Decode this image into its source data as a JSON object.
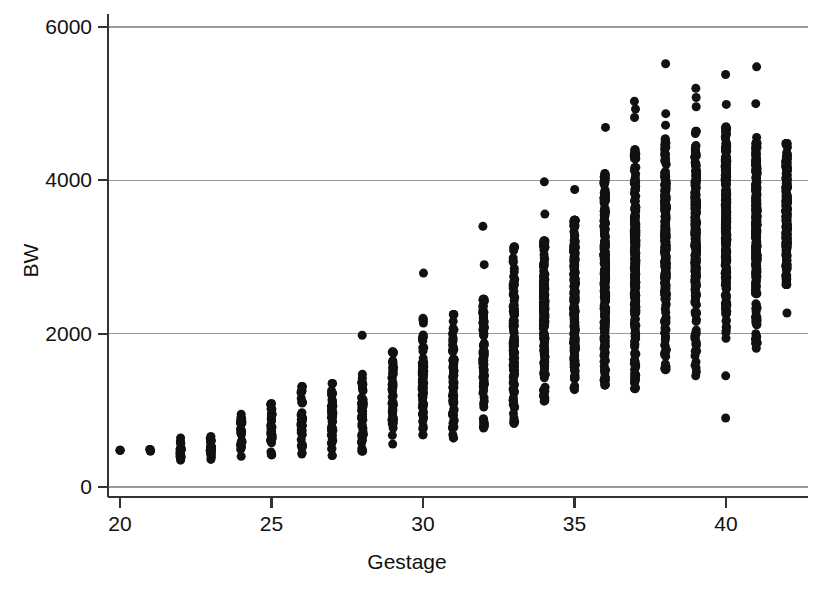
{
  "chart_data": {
    "type": "scatter",
    "title": "",
    "xlabel": "Gestage",
    "ylabel": "BW",
    "xlim": [
      19.2,
      42.8
    ],
    "ylim": [
      -250,
      6250
    ],
    "xticks": [
      20,
      25,
      30,
      35,
      40
    ],
    "yticks": [
      0,
      2000,
      4000,
      6000
    ],
    "grid": "horizontal",
    "grid_color": "#999999",
    "axis_color": "#333333",
    "point_color": "#111111",
    "point_size_px": 9,
    "background": "#ffffff",
    "legend": "none",
    "columns": [
      {
        "x": 20,
        "n": 1,
        "min": 480,
        "max": 480,
        "p25": 480,
        "median": 480,
        "p75": 480
      },
      {
        "x": 21,
        "n": 2,
        "min": 470,
        "max": 490,
        "p25": 475,
        "median": 480,
        "p75": 485
      },
      {
        "x": 22,
        "n": 14,
        "min": 350,
        "max": 640,
        "p25": 420,
        "median": 470,
        "p75": 530
      },
      {
        "x": 23,
        "n": 20,
        "min": 360,
        "max": 660,
        "p25": 450,
        "median": 500,
        "p75": 570
      },
      {
        "x": 24,
        "n": 26,
        "min": 400,
        "max": 950,
        "p25": 560,
        "median": 650,
        "p75": 740
      },
      {
        "x": 25,
        "n": 32,
        "min": 420,
        "max": 1090,
        "p25": 620,
        "median": 730,
        "p75": 840
      },
      {
        "x": 26,
        "n": 36,
        "min": 430,
        "max": 1310,
        "p25": 680,
        "median": 820,
        "p75": 960
      },
      {
        "x": 27,
        "n": 40,
        "min": 410,
        "max": 1350,
        "p25": 760,
        "median": 920,
        "p75": 1070
      },
      {
        "x": 28,
        "n": 46,
        "min": 470,
        "max": 1470,
        "p25": 830,
        "median": 1010,
        "p75": 1180,
        "outliers": [
          1980
        ]
      },
      {
        "x": 29,
        "n": 52,
        "min": 560,
        "max": 1760,
        "p25": 950,
        "median": 1150,
        "p75": 1360
      },
      {
        "x": 30,
        "n": 66,
        "min": 680,
        "max": 2200,
        "p25": 1100,
        "median": 1340,
        "p75": 1590,
        "outliers": [
          2790
        ]
      },
      {
        "x": 31,
        "n": 72,
        "min": 640,
        "max": 2250,
        "p25": 1220,
        "median": 1500,
        "p75": 1790
      },
      {
        "x": 32,
        "n": 96,
        "min": 770,
        "max": 2450,
        "p25": 1420,
        "median": 1740,
        "p75": 2010,
        "outliers": [
          3400,
          2900
        ]
      },
      {
        "x": 33,
        "n": 110,
        "min": 830,
        "max": 3130,
        "p25": 1600,
        "median": 1960,
        "p75": 2290
      },
      {
        "x": 34,
        "n": 150,
        "min": 1120,
        "max": 3210,
        "p25": 1890,
        "median": 2260,
        "p75": 2630,
        "outliers": [
          3980,
          3560
        ]
      },
      {
        "x": 35,
        "n": 200,
        "min": 1270,
        "max": 3480,
        "p25": 2120,
        "median": 2520,
        "p75": 2890,
        "outliers": [
          3880
        ]
      },
      {
        "x": 36,
        "n": 320,
        "min": 1330,
        "max": 4090,
        "p25": 2380,
        "median": 2760,
        "p75": 3130,
        "outliers": [
          4690
        ]
      },
      {
        "x": 37,
        "n": 620,
        "min": 1280,
        "max": 4400,
        "p25": 2700,
        "median": 3050,
        "p75": 3400,
        "outliers": [
          5030,
          4930,
          4820
        ]
      },
      {
        "x": 38,
        "n": 1050,
        "min": 1530,
        "max": 4540,
        "p25": 2890,
        "median": 3240,
        "p75": 3580,
        "outliers": [
          5520,
          4870,
          4720
        ]
      },
      {
        "x": 39,
        "n": 1200,
        "min": 1450,
        "max": 4640,
        "p25": 3010,
        "median": 3360,
        "p75": 3700,
        "outliers": [
          5200,
          5080,
          4960
        ]
      },
      {
        "x": 40,
        "n": 1150,
        "min": 1940,
        "max": 4700,
        "p25": 3100,
        "median": 3450,
        "p75": 3790,
        "outliers": [
          5380,
          4990,
          1450,
          900
        ]
      },
      {
        "x": 41,
        "n": 620,
        "min": 1810,
        "max": 4480,
        "p25": 3130,
        "median": 3490,
        "p75": 3830,
        "outliers": [
          5480,
          5000,
          4560,
          2140,
          2000
        ]
      },
      {
        "x": 42,
        "n": 180,
        "min": 2640,
        "max": 4480,
        "p25": 3140,
        "median": 3490,
        "p75": 3840,
        "outliers": [
          2270
        ]
      }
    ]
  }
}
